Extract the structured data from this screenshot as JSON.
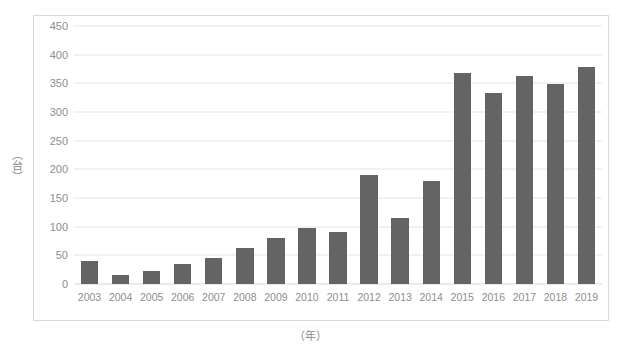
{
  "chart_data": {
    "type": "bar",
    "title": "",
    "subtitle": "",
    "xlabel": "（年）",
    "ylabel": "（台）",
    "categories": [
      "2003",
      "2004",
      "2005",
      "2006",
      "2007",
      "2008",
      "2009",
      "2010",
      "2011",
      "2012",
      "2013",
      "2014",
      "2015",
      "2016",
      "2017",
      "2018",
      "2019"
    ],
    "values": [
      40,
      15,
      22,
      35,
      45,
      62,
      80,
      97,
      90,
      190,
      115,
      180,
      368,
      334,
      363,
      348,
      378
    ],
    "series": [
      {
        "name": "",
        "values": [
          40,
          15,
          22,
          35,
          45,
          62,
          80,
          97,
          90,
          190,
          115,
          180,
          368,
          334,
          363,
          348,
          378
        ]
      }
    ],
    "ylim": [
      0,
      450
    ],
    "y_ticks": [
      0,
      50,
      100,
      150,
      200,
      250,
      300,
      350,
      400,
      450
    ],
    "y_tick_labels": [
      "0",
      "50",
      "100",
      "150",
      "200",
      "250",
      "300",
      "350",
      "400",
      "450"
    ],
    "grid": "horizontal",
    "legend": "none",
    "bar_color": "#646464",
    "gridline_color": "#e6e6e6",
    "border_color": "#d9d9d9",
    "tick_label_color": "#8e8e8e",
    "background": "#ffffff"
  }
}
